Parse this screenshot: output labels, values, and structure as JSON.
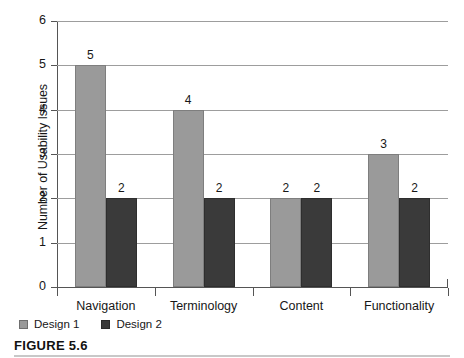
{
  "caption": {
    "label": "FIGURE 5.6"
  },
  "legend": {
    "position": "bottom-left",
    "items": [
      {
        "label": "Design 1",
        "color": "#9a9a9a",
        "swatch": "legend-swatch-icon"
      },
      {
        "label": "Design 2",
        "color": "#3a3a3a",
        "swatch": "legend-swatch-icon"
      }
    ]
  },
  "chart_data": {
    "type": "bar",
    "title": "",
    "xlabel": "",
    "ylabel": "Number of Usability Issues",
    "ylim": [
      0,
      6
    ],
    "yticks": [
      0,
      1,
      2,
      3,
      4,
      5,
      6
    ],
    "ytick_labels": [
      "0",
      "1",
      "2",
      "3",
      "4",
      "5",
      "6"
    ],
    "grid": true,
    "grid_axis": "y",
    "legend_position": "bottom-left",
    "categories": [
      "Navigation",
      "Terminology",
      "Content",
      "Functionality"
    ],
    "series": [
      {
        "name": "Design 1",
        "color": "#9a9a9a",
        "values": [
          5,
          4,
          2,
          3
        ]
      },
      {
        "name": "Design 2",
        "color": "#3a3a3a",
        "values": [
          2,
          2,
          2,
          2
        ]
      }
    ],
    "data_labels": [
      [
        "5",
        "4",
        "2",
        "3"
      ],
      [
        "2",
        "2",
        "2",
        "2"
      ]
    ]
  }
}
